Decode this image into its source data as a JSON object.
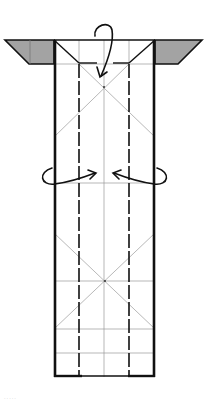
{
  "diagram": {
    "type": "origami-fold-diagram",
    "colors": {
      "background": "#ffffff",
      "outline": "#111111",
      "crease": "#9a9a9a",
      "flap_fill": "#9e9e9e",
      "arrow": "#111111"
    },
    "paper": {
      "left": 54,
      "right": 155,
      "top": 40,
      "bottom": 377
    },
    "flaps": [
      {
        "name": "left-flap",
        "points": "5,40 54,40 54,64 29,64"
      },
      {
        "name": "right-flap",
        "points": "155,40 202,40 178,64 155,64"
      }
    ],
    "valley_folds_x": [
      79,
      129
    ],
    "center_x": 104,
    "horizontal_creases_y": [
      64,
      183,
      281,
      329,
      353
    ],
    "arrows": [
      {
        "name": "fold-top-down-arrow",
        "direction": "down"
      },
      {
        "name": "fold-left-behind-arrow",
        "direction": "right"
      },
      {
        "name": "fold-right-behind-arrow",
        "direction": "left"
      }
    ]
  },
  "caption": "....."
}
